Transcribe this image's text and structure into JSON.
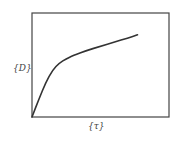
{
  "chart_data": {
    "type": "line",
    "title": "",
    "xlabel": "{τ}",
    "ylabel": "{D}",
    "grid": false,
    "legend": null,
    "xlim": [
      0,
      1
    ],
    "ylim": [
      0,
      1
    ],
    "series": [
      {
        "name": "D vs τ",
        "x": [
          0,
          0.05,
          0.1,
          0.15,
          0.2,
          0.25,
          0.3,
          0.4,
          0.5,
          0.6,
          0.7,
          0.77
        ],
        "y": [
          0,
          0.17,
          0.33,
          0.45,
          0.52,
          0.56,
          0.59,
          0.64,
          0.68,
          0.72,
          0.76,
          0.79
        ]
      }
    ],
    "colors": {
      "line": "#333333",
      "frame": "#444444"
    }
  }
}
